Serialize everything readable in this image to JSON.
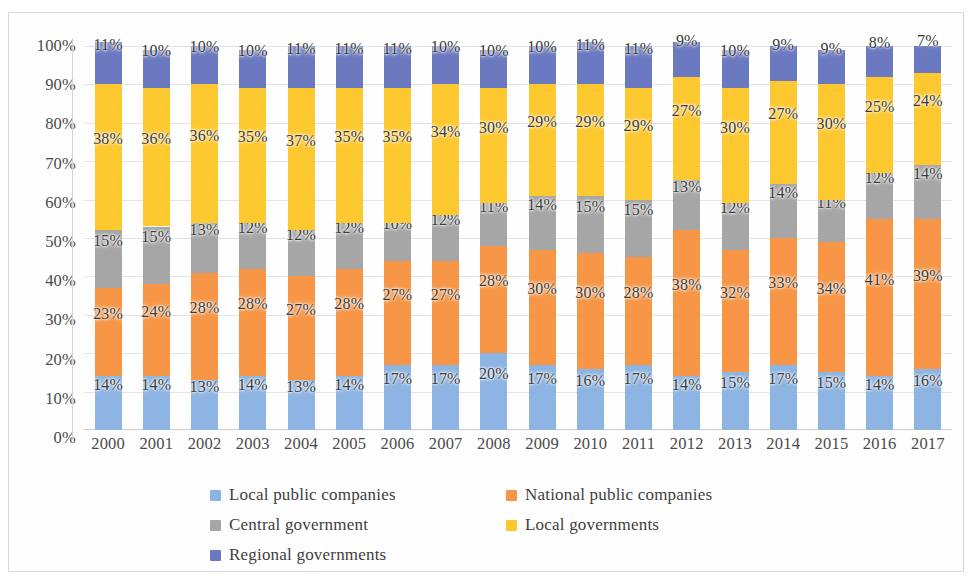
{
  "chart_data": {
    "type": "bar",
    "subtype": "stacked-100-percent",
    "title": "",
    "subtitle": "",
    "xlabel": "",
    "ylabel": "",
    "ylim": [
      0,
      100
    ],
    "grid": true,
    "legend_position": "bottom",
    "value_suffix": "%",
    "categories": [
      "2000",
      "2001",
      "2002",
      "2003",
      "2004",
      "2005",
      "2006",
      "2007",
      "2008",
      "2009",
      "2010",
      "2011",
      "2012",
      "2013",
      "2014",
      "2015",
      "2016",
      "2017"
    ],
    "ytick_labels": [
      "100%",
      "90%",
      "80%",
      "70%",
      "60%",
      "50%",
      "40%",
      "30%",
      "20%",
      "10%",
      "0%"
    ],
    "ytick_values": [
      100,
      90,
      80,
      70,
      60,
      50,
      40,
      30,
      20,
      10,
      0
    ],
    "series": [
      {
        "name": "Local public companies",
        "color": "#8db4e2",
        "values": [
          14,
          14,
          13,
          14,
          13,
          14,
          17,
          17,
          20,
          17,
          16,
          17,
          14,
          15,
          17,
          15,
          14,
          16
        ]
      },
      {
        "name": "National public companies",
        "color": "#f79646",
        "values": [
          23,
          24,
          28,
          28,
          27,
          28,
          27,
          27,
          28,
          30,
          30,
          28,
          38,
          32,
          33,
          34,
          41,
          39
        ]
      },
      {
        "name": "Central government",
        "color": "#a6a6a6",
        "values": [
          15,
          15,
          13,
          12,
          12,
          12,
          10,
          12,
          11,
          14,
          15,
          15,
          13,
          12,
          14,
          11,
          12,
          14
        ]
      },
      {
        "name": "Local governments",
        "color": "#fdc830",
        "values": [
          38,
          36,
          36,
          35,
          37,
          35,
          35,
          34,
          30,
          29,
          29,
          29,
          27,
          30,
          27,
          30,
          25,
          24
        ]
      },
      {
        "name": "Regional governments",
        "color": "#6b79c1",
        "values": [
          11,
          10,
          10,
          10,
          11,
          11,
          11,
          10,
          10,
          10,
          11,
          11,
          9,
          10,
          9,
          9,
          8,
          7
        ]
      }
    ]
  },
  "legend": {
    "items": [
      {
        "label": "Local public companies",
        "icon": "legend-swatch-blue",
        "color": "#8db4e2"
      },
      {
        "label": "National public companies",
        "icon": "legend-swatch-orange",
        "color": "#f79646"
      },
      {
        "label": "Central government",
        "icon": "legend-swatch-gray",
        "color": "#a6a6a6"
      },
      {
        "label": "Local governments",
        "icon": "legend-swatch-yellow",
        "color": "#fdc830"
      },
      {
        "label": "Regional governments",
        "icon": "legend-swatch-purple",
        "color": "#6b79c1"
      }
    ]
  }
}
